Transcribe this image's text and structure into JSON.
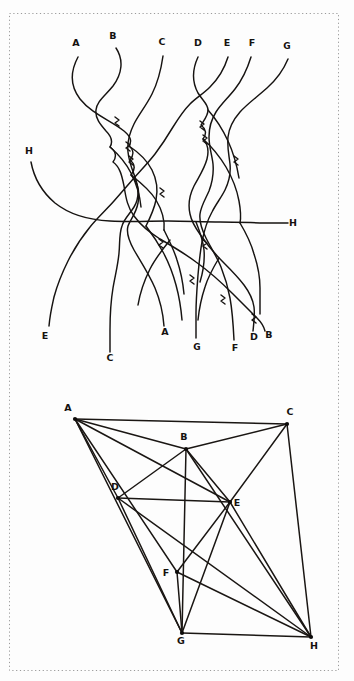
{
  "figure": {
    "title": "",
    "background_color": "#fdfdfd",
    "ink_color": "#161311",
    "frame_color": "#9a9a9a",
    "width": 354,
    "height": 681
  },
  "braid_diagram": {
    "name": "tangled-strand-diagram",
    "description": "Hand-drawn braid / strand crossing diagram with eight labelled strands A-H entering and leaving the tangle",
    "strand_count": 8,
    "top_labels": [
      {
        "text": "A",
        "x": 76,
        "y": 46
      },
      {
        "text": "B",
        "x": 113,
        "y": 39
      },
      {
        "text": "C",
        "x": 162,
        "y": 45
      },
      {
        "text": "D",
        "x": 198,
        "y": 46
      },
      {
        "text": "E",
        "x": 227,
        "y": 46
      },
      {
        "text": "F",
        "x": 252,
        "y": 46
      },
      {
        "text": "G",
        "x": 287,
        "y": 49
      }
    ],
    "side_labels": [
      {
        "text": "H",
        "x": 29,
        "y": 154,
        "side": "left"
      },
      {
        "text": "H",
        "x": 291,
        "y": 226,
        "side": "right"
      }
    ],
    "bottom_labels": [
      {
        "text": "E",
        "x": 45,
        "y": 339
      },
      {
        "text": "C",
        "x": 110,
        "y": 361
      },
      {
        "text": "A",
        "x": 165,
        "y": 335
      },
      {
        "text": "G",
        "x": 197,
        "y": 350
      },
      {
        "text": "F",
        "x": 235,
        "y": 351
      },
      {
        "text": "D",
        "x": 254,
        "y": 340
      },
      {
        "text": "B",
        "x": 269,
        "y": 338
      }
    ],
    "permutation": {
      "in_order": [
        "A",
        "B",
        "C",
        "D",
        "E",
        "F",
        "G",
        "H"
      ],
      "out_order": [
        "E",
        "C",
        "A",
        "G",
        "F",
        "D",
        "B",
        "H"
      ]
    }
  },
  "graph_diagram": {
    "name": "node-link-graph",
    "description": "Hand-drawn straight-line graph drawing of the same eight vertices A-H with chords",
    "nodes": [
      {
        "id": "A",
        "x": 75,
        "y": 419,
        "label_dx": -7,
        "label_dy": -8
      },
      {
        "id": "B",
        "x": 186,
        "y": 449,
        "label_dx": -2,
        "label_dy": -9
      },
      {
        "id": "C",
        "x": 287,
        "y": 424,
        "label_dx": 3,
        "label_dy": -9
      },
      {
        "id": "D",
        "x": 118,
        "y": 498,
        "label_dx": -3,
        "label_dy": -8
      },
      {
        "id": "E",
        "x": 230,
        "y": 502,
        "label_dx": 7,
        "label_dy": 4
      },
      {
        "id": "F",
        "x": 177,
        "y": 572,
        "label_dx": -11,
        "label_dy": 4
      },
      {
        "id": "G",
        "x": 182,
        "y": 633,
        "label_dx": -1,
        "label_dy": 11
      },
      {
        "id": "H",
        "x": 311,
        "y": 637,
        "label_dx": 3,
        "label_dy": 12
      }
    ],
    "edges": [
      [
        "A",
        "B"
      ],
      [
        "A",
        "C"
      ],
      [
        "A",
        "D"
      ],
      [
        "A",
        "E"
      ],
      [
        "A",
        "F"
      ],
      [
        "A",
        "G"
      ],
      [
        "B",
        "C"
      ],
      [
        "B",
        "D"
      ],
      [
        "B",
        "E"
      ],
      [
        "B",
        "G"
      ],
      [
        "B",
        "H"
      ],
      [
        "C",
        "E"
      ],
      [
        "C",
        "H"
      ],
      [
        "D",
        "E"
      ],
      [
        "D",
        "G"
      ],
      [
        "D",
        "H"
      ],
      [
        "E",
        "F"
      ],
      [
        "E",
        "G"
      ],
      [
        "E",
        "H"
      ],
      [
        "F",
        "G"
      ],
      [
        "F",
        "H"
      ],
      [
        "G",
        "H"
      ]
    ],
    "edge_count": 22,
    "node_count": 8
  }
}
